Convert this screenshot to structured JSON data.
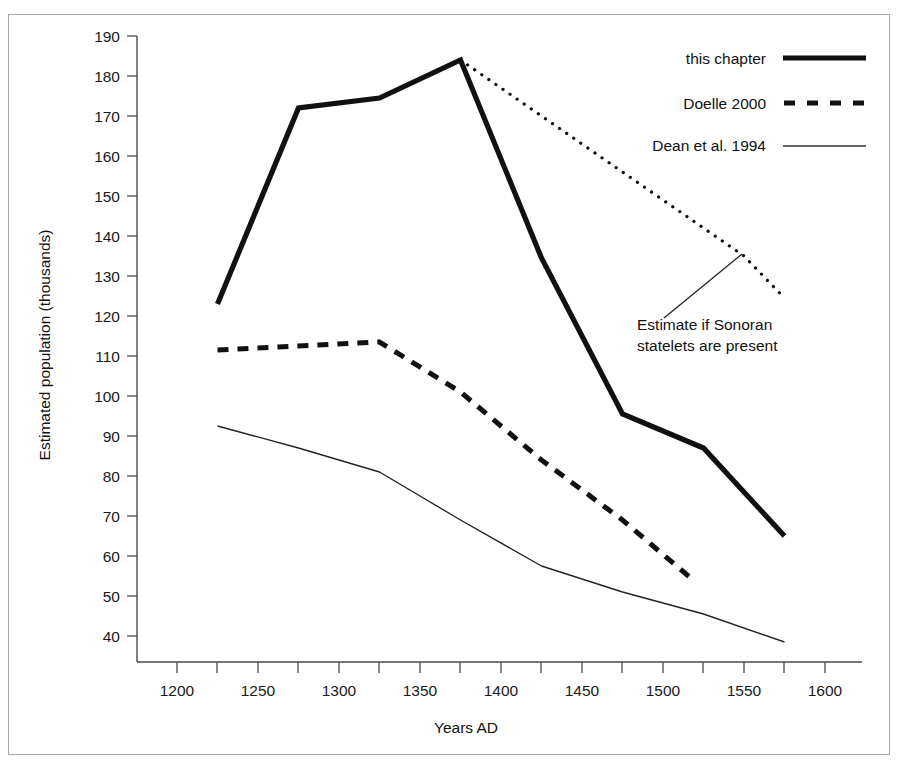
{
  "chart_data": {
    "type": "line",
    "title": "",
    "xlabel": "Years AD",
    "ylabel": "Estimated population (thousands)",
    "xlim": [
      1180,
      1620
    ],
    "ylim": [
      35,
      190
    ],
    "grid": false,
    "legend_position": "top-right",
    "x_ticks": [
      1200,
      1250,
      1300,
      1350,
      1400,
      1450,
      1500,
      1550,
      1600
    ],
    "x_minor_ticks": [
      1225,
      1275,
      1325,
      1375,
      1425,
      1475,
      1525,
      1575
    ],
    "y_ticks": [
      40,
      50,
      60,
      70,
      80,
      90,
      100,
      110,
      120,
      130,
      140,
      150,
      160,
      170,
      180,
      190
    ],
    "series": [
      {
        "name": "this chapter",
        "style": "thick-solid",
        "x": [
          1225,
          1275,
          1325,
          1375,
          1425,
          1475,
          1525,
          1575
        ],
        "values": [
          123,
          172,
          174.5,
          184,
          134.5,
          95.5,
          87,
          65
        ]
      },
      {
        "name": "Estimate if Sonoran statelets are present",
        "style": "dotted",
        "x": [
          1375,
          1550,
          1575
        ],
        "values": [
          184,
          135,
          124.5
        ]
      },
      {
        "name": "Doelle 2000",
        "style": "dashed",
        "x": [
          1225,
          1275,
          1325,
          1375,
          1425,
          1475,
          1520
        ],
        "values": [
          111.5,
          112.5,
          113.5,
          101,
          84,
          69,
          53.5
        ]
      },
      {
        "name": "Dean et al. 1994",
        "style": "thin-solid",
        "x": [
          1225,
          1275,
          1325,
          1375,
          1425,
          1475,
          1525,
          1575
        ],
        "values": [
          92.5,
          87,
          81,
          69,
          57.5,
          51,
          45.5,
          38.5
        ]
      }
    ],
    "annotations": [
      {
        "text_line_1": "Estimate if Sonoran",
        "text_line_2": "statelets are present",
        "points_to_series": "Estimate if Sonoran statelets are present"
      }
    ]
  },
  "legend": {
    "items": [
      {
        "label": "this chapter",
        "sample": "thick-solid-line-icon"
      },
      {
        "label": "Doelle 2000",
        "sample": "dashed-line-icon"
      },
      {
        "label": "Dean et al. 1994",
        "sample": "thin-solid-line-icon"
      }
    ]
  },
  "axes": {
    "y_title": "Estimated population (thousands)",
    "x_title": "Years AD",
    "y_tick_labels": [
      "190",
      "180",
      "170",
      "160",
      "150",
      "140",
      "130",
      "120",
      "110",
      "100",
      "90",
      "80",
      "70",
      "60",
      "50",
      "40"
    ],
    "x_tick_labels": [
      "1200",
      "1250",
      "1300",
      "1350",
      "1400",
      "1450",
      "1500",
      "1550",
      "1600"
    ]
  },
  "annotation": {
    "line_1": "Estimate if Sonoran",
    "line_2": "statelets are present"
  },
  "colors": {
    "ink": "#111111",
    "axis": "#4a4a4a",
    "frame": "#a8a8a8",
    "background": "#ffffff"
  }
}
